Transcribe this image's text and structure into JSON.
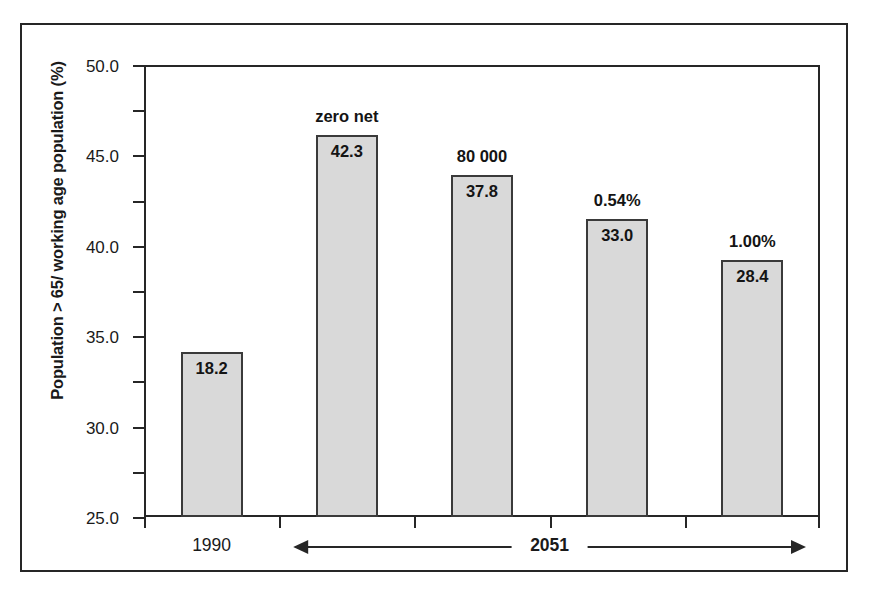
{
  "chart_data": {
    "type": "bar",
    "title": "",
    "xlabel": "",
    "ylabel": "Population > 65/ working age population (%)",
    "ylim": [
      0,
      50
    ],
    "ytick_step": 5,
    "ytick_labels": [
      "50.0",
      "45.0",
      "40.0",
      "35.0",
      "30.0",
      "25.0",
      "20.0",
      "15.0",
      "10.0",
      "5.0",
      "0.0"
    ],
    "ytick_values": [
      50.0,
      45.0,
      40.0,
      35.0,
      30.0,
      25.0,
      20.0,
      15.0,
      10.0,
      5.0,
      0.0
    ],
    "grid": false,
    "legend": "none",
    "categories": [
      "1990",
      "zero net",
      "80 000",
      "0.54%",
      "1.00%"
    ],
    "values": [
      18.2,
      42.3,
      37.8,
      33.0,
      28.4
    ],
    "value_labels": [
      "18.2",
      "42.3",
      "37.8",
      "33.0",
      "28.4"
    ],
    "bar_annotations": [
      "",
      "zero net",
      "80 000",
      "0.54%",
      "1.00%"
    ],
    "bar_fill_color": "#d9d9d9",
    "bar_edge_color": "#3a3a3a",
    "axis_color": "#262626",
    "axis_groups": [
      {
        "label": "1990",
        "span_start": 0,
        "span_end": 0,
        "arrow": "none",
        "bold": false
      },
      {
        "label": "2051",
        "span_start": 1,
        "span_end": 4,
        "arrow": "double",
        "bold": true
      }
    ]
  },
  "axis": {
    "y_title": "Population > 65/ working age population (%)",
    "x_group_1": "1990",
    "x_group_2": "2051"
  },
  "bars": [
    {
      "value_label": "18.2",
      "annotation": ""
    },
    {
      "value_label": "42.3",
      "annotation": "zero net"
    },
    {
      "value_label": "37.8",
      "annotation": "80 000"
    },
    {
      "value_label": "33.0",
      "annotation": "0.54%"
    },
    {
      "value_label": "28.4",
      "annotation": "1.00%"
    }
  ],
  "yticks": [
    {
      "label": "50.0"
    },
    {
      "label": "45.0"
    },
    {
      "label": "40.0"
    },
    {
      "label": "35.0"
    },
    {
      "label": "30.0"
    },
    {
      "label": "25.0"
    },
    {
      "label": "20.0"
    },
    {
      "label": "15.0"
    },
    {
      "label": "10.0"
    },
    {
      "label": "5.0"
    },
    {
      "label": "0.0"
    }
  ]
}
